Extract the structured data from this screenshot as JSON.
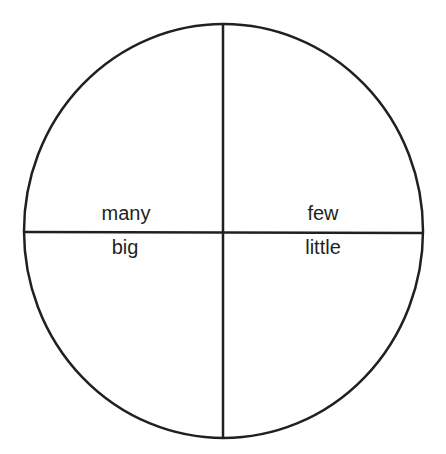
{
  "diagram": {
    "shape": "circle-divided-into-quadrants",
    "stroke_color": "#231f20",
    "background": "#ffffff",
    "labels": {
      "top_left": "many",
      "top_right": "few",
      "bottom_left": "big",
      "bottom_right": "little"
    }
  }
}
